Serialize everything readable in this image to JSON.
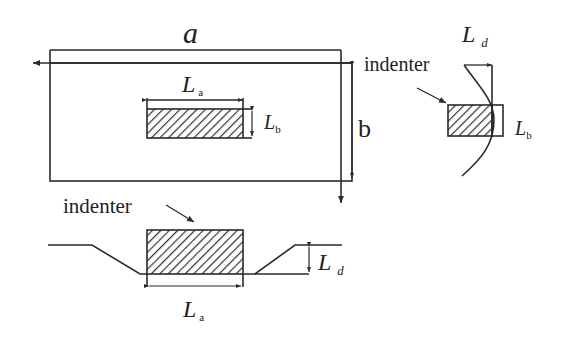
{
  "figure": {
    "top_view": {
      "width_label": "a",
      "height_label": "b",
      "indent_length_label": "L",
      "indent_length_sub": "a",
      "indent_width_label": "L",
      "indent_width_sub": "b"
    },
    "side_view": {
      "indenter_label": "indenter",
      "depth_label": "L",
      "depth_sub": "d",
      "width_label": "L",
      "width_sub": "b"
    },
    "front_view": {
      "indenter_label": "indenter",
      "depth_label": "L",
      "depth_sub": "d",
      "length_label": "L",
      "length_sub": "a"
    },
    "colors": {
      "line": "#2a2a2a",
      "hatch": "#333333",
      "background": "#ffffff"
    }
  }
}
